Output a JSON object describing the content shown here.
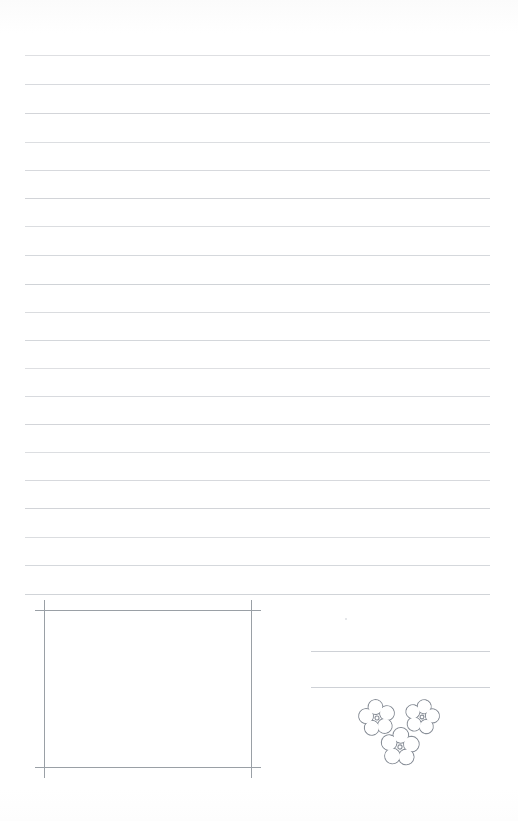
{
  "page": {
    "kind": "scanned-worksheet-page",
    "width": 518,
    "height": 821,
    "background_color": "#ffffff",
    "title": "",
    "visible_text": ""
  },
  "ink": {
    "rule_color": "#c9ccd1",
    "box_color": "#9aa0a6",
    "flower_color": "#8a9099",
    "speck_color": "#dcdfe3"
  },
  "ruled_lines": {
    "count": 19,
    "x_start": 25,
    "x_end": 490,
    "thickness": 1,
    "y_positions": [
      55,
      84,
      113,
      142,
      170,
      198,
      226,
      255,
      284,
      312,
      340,
      368,
      396,
      424,
      452,
      480,
      508,
      537,
      565
    ]
  },
  "bottom_rule": {
    "y": 594,
    "x_start": 25,
    "x_end": 490
  },
  "drawing_box": {
    "label": "drawing-frame",
    "left_vertical": {
      "x": 44,
      "y_start": 600,
      "y_end": 778
    },
    "right_vertical": {
      "x": 251,
      "y_start": 600,
      "y_end": 778
    },
    "top_horizontal": {
      "y": 610,
      "x_start": 35,
      "x_end": 261
    },
    "bottom_horizontal": {
      "y": 767,
      "x_start": 35,
      "x_end": 261
    }
  },
  "answer_lines": {
    "count": 2,
    "x_start": 311,
    "x_end": 490,
    "y_positions": [
      651,
      687
    ]
  },
  "speck": {
    "x": 345,
    "y": 618,
    "size": 2
  },
  "flowers": [
    {
      "name": "flower-left",
      "cx": 377,
      "cy": 718,
      "r": 17,
      "petal": 7.4,
      "center_dot": 2.0,
      "rotation": -8
    },
    {
      "name": "flower-right",
      "cx": 422,
      "cy": 717,
      "r": 16,
      "petal": 7.0,
      "center_dot": 1.9,
      "rotation": 12
    },
    {
      "name": "flower-bottom",
      "cx": 400,
      "cy": 747,
      "r": 18,
      "petal": 7.8,
      "center_dot": 2.1,
      "rotation": 4
    }
  ]
}
